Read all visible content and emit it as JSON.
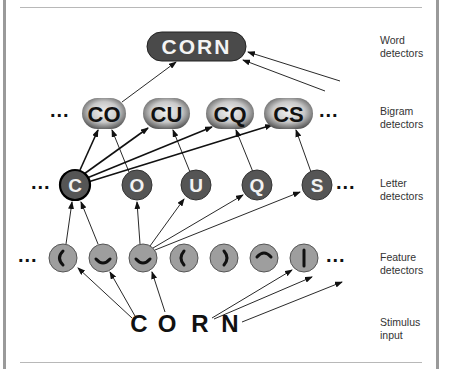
{
  "levels": {
    "word": {
      "label_line1": "Word",
      "label_line2": "detectors",
      "nodes": [
        "CORN"
      ]
    },
    "bigram": {
      "label_line1": "Bigram",
      "label_line2": "detectors",
      "nodes": [
        "CO",
        "CU",
        "CQ",
        "CS"
      ]
    },
    "letter": {
      "label_line1": "Letter",
      "label_line2": "detectors",
      "nodes": [
        "C",
        "O",
        "U",
        "Q",
        "S"
      ]
    },
    "feature": {
      "label_line1": "Feature",
      "label_line2": "detectors",
      "nodes": [
        "left-curve",
        "bottom-curve",
        "bottom-curve",
        "left-curve",
        "right-curve",
        "top-curve",
        "vertical-line"
      ]
    },
    "stimulus": {
      "label_line1": "Stimulus",
      "label_line2": "input",
      "letters": [
        "C",
        "O",
        "R",
        "N"
      ]
    }
  },
  "ellipsis": "...",
  "colors": {
    "word_fill": "#4a4a4a",
    "letter_fill": "#555555",
    "feature_fill": "#9e9e9e",
    "bigram_edge": "#555555",
    "bigram_center": "#e8e8e8",
    "frame": "#9a9a9a"
  }
}
